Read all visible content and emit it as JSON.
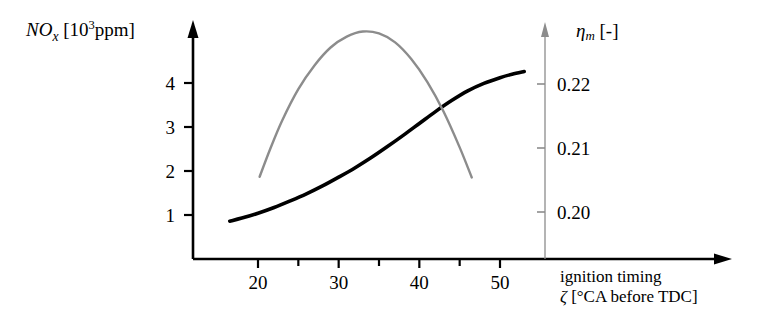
{
  "chart_data": {
    "type": "line",
    "title": "",
    "xlabel": "ignition timing  ζ [°CA before TDC]",
    "xlabel_line1": "ignition timing",
    "xlabel_line2_symbol": "ζ",
    "xlabel_line2_unit": " [°CA before TDC]",
    "ylabel_left_symbol": "NO",
    "ylabel_left_sub": "x",
    "ylabel_left_unit_open": " [10",
    "ylabel_left_unit_exp": "3",
    "ylabel_left_unit_close": "ppm]",
    "ylabel_right_symbol": "η",
    "ylabel_right_sub": "m",
    "ylabel_right_unit": " [-]",
    "xlim": [
      13,
      57
    ],
    "xticks": [
      20,
      25,
      30,
      35,
      40,
      45,
      50
    ],
    "xticklabels": [
      "20",
      "",
      "30",
      "",
      "40",
      "",
      "50"
    ],
    "ylim_left": [
      0,
      4.55
    ],
    "yticks_left": [
      1,
      2,
      3,
      4
    ],
    "yticklabels_left": [
      "1",
      "2",
      "3",
      "4"
    ],
    "ylim_right": [
      0.1935,
      0.2315
    ],
    "yticks_right": [
      0.2,
      0.21,
      0.22
    ],
    "yticklabels_right": [
      "0.20",
      "0.21",
      "0.22"
    ],
    "grid": false,
    "legend": "none",
    "series": [
      {
        "name": "NOx",
        "axis": "left",
        "color": "#000000",
        "width": 3.6,
        "points": [
          [
            16.5,
            0.86
          ],
          [
            18,
            0.93
          ],
          [
            20,
            1.04
          ],
          [
            22,
            1.17
          ],
          [
            24,
            1.32
          ],
          [
            26,
            1.48
          ],
          [
            28,
            1.66
          ],
          [
            30,
            1.86
          ],
          [
            32,
            2.07
          ],
          [
            34,
            2.3
          ],
          [
            36,
            2.55
          ],
          [
            38,
            2.81
          ],
          [
            40,
            3.08
          ],
          [
            42,
            3.35
          ],
          [
            44,
            3.6
          ],
          [
            46,
            3.82
          ],
          [
            48,
            3.99
          ],
          [
            50,
            4.12
          ],
          [
            51.5,
            4.2
          ],
          [
            53,
            4.26
          ]
        ]
      },
      {
        "name": "eta_m",
        "axis": "right",
        "color": "#8c8c8c",
        "width": 2.4,
        "points": [
          [
            20.2,
            0.2055
          ],
          [
            21.5,
            0.2098
          ],
          [
            23,
            0.2143
          ],
          [
            25,
            0.2192
          ],
          [
            27,
            0.2229
          ],
          [
            29,
            0.2257
          ],
          [
            31,
            0.2274
          ],
          [
            33,
            0.2282
          ],
          [
            35,
            0.2279
          ],
          [
            37,
            0.2265
          ],
          [
            39,
            0.2239
          ],
          [
            41,
            0.2203
          ],
          [
            43,
            0.2157
          ],
          [
            45,
            0.2101
          ],
          [
            46.5,
            0.2054
          ]
        ]
      }
    ],
    "axis_colors": {
      "left_axis": "#000000",
      "bottom_axis": "#000000",
      "right_axis": "#8c8c8c",
      "background": "#ffffff"
    }
  },
  "ytick_labels_left": [
    "4",
    "3",
    "2",
    "1"
  ],
  "ytick_labels_right": [
    "0.22",
    "0.21",
    "0.20"
  ],
  "xtick_labels": [
    "20",
    "30",
    "40",
    "50"
  ]
}
